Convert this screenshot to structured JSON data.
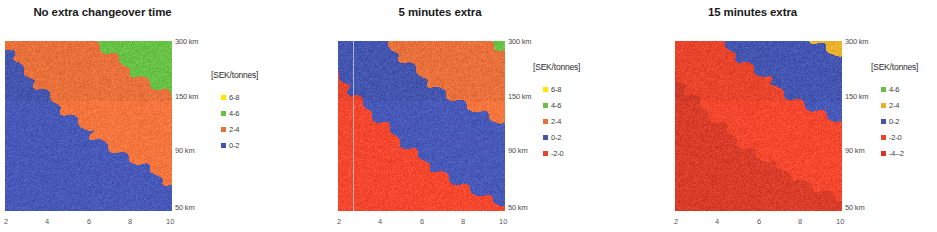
{
  "figure": {
    "units_label": "[SEK/tonnes]",
    "x_ticks": [
      "2",
      "4",
      "6",
      "8",
      "10"
    ],
    "y_ticks": [
      "300 km",
      "150 km",
      "90 km",
      "50 km"
    ]
  },
  "panels": [
    {
      "title": "No extra changeover time",
      "legend_title": "[SEK/tonnes]",
      "legend": [
        {
          "label": "6-8",
          "color": "#ffe600"
        },
        {
          "label": "4-6",
          "color": "#66c145"
        },
        {
          "label": "2-4",
          "color": "#e8703a"
        },
        {
          "label": "0-2",
          "color": "#4455b0"
        }
      ],
      "x_ticks": [
        "2",
        "4",
        "6",
        "8",
        "10"
      ],
      "y_ticks": [
        "300 km",
        "150 km",
        "90 km",
        "50 km"
      ]
    },
    {
      "title": "5 minutes extra",
      "legend_title": "[SEK/tonnes]",
      "legend": [
        {
          "label": "6-8",
          "color": "#ffe600"
        },
        {
          "label": "4-6",
          "color": "#66c145"
        },
        {
          "label": "2-4",
          "color": "#e8703a"
        },
        {
          "label": "0-2",
          "color": "#4455b0"
        },
        {
          "label": "-2-0",
          "color": "#e8442c"
        }
      ],
      "x_ticks": [
        "2",
        "4",
        "6",
        "8",
        "10"
      ],
      "y_ticks": [
        "300 km",
        "150 km",
        "90 km",
        "50 km"
      ]
    },
    {
      "title": "15 minutes extra",
      "legend_title": "[SEK/tonnes]",
      "legend": [
        {
          "label": "4-6",
          "color": "#66c145"
        },
        {
          "label": "2-4",
          "color": "#e8b12a"
        },
        {
          "label": "0-2",
          "color": "#4455b0"
        },
        {
          "label": "-2-0",
          "color": "#e8442c"
        },
        {
          "label": "-4--2",
          "color": "#cf3a28"
        }
      ],
      "x_ticks": [
        "2",
        "4",
        "6",
        "8",
        "10"
      ],
      "y_ticks": [
        "300 km",
        "150 km",
        "90 km",
        "50 km"
      ]
    }
  ],
  "chart_data": [
    {
      "type": "heatmap",
      "title": "No extra changeover time",
      "xlabel": "",
      "ylabel": "",
      "x": [
        2,
        4,
        6,
        8,
        10
      ],
      "y_tick_labels": [
        "50 km",
        "90 km",
        "150 km",
        "300 km"
      ],
      "legend_position": "right",
      "grid": false,
      "bands": [
        "0-2",
        "2-4",
        "4-6",
        "6-8"
      ],
      "band_colors": [
        "#4455b0",
        "#e8703a",
        "#66c145",
        "#ffe600"
      ],
      "note": "Cost surface vs number of trucks (x: 2-10) and distance (y: 50-300 km). Lower-left region is 0-2 SEK/tonnes (blue); a broad 2-4 (orange) diagonal band rises to upper-right; 4-6 (green) occupies the top-right corner; 6-8 (yellow) appears only as a sliver at extreme top-right.",
      "values": [
        [
          0.4,
          0.6,
          0.9,
          1.2,
          1.5
        ],
        [
          0.6,
          0.9,
          1.3,
          1.8,
          2.3
        ],
        [
          0.9,
          1.4,
          2.1,
          2.8,
          3.3
        ],
        [
          1.4,
          2.2,
          3.0,
          3.7,
          4.3
        ],
        [
          2.1,
          3.1,
          3.9,
          4.6,
          5.4
        ]
      ]
    },
    {
      "type": "heatmap",
      "title": "5 minutes extra",
      "xlabel": "",
      "ylabel": "",
      "x": [
        2,
        4,
        6,
        8,
        10
      ],
      "y_tick_labels": [
        "50 km",
        "90 km",
        "150 km",
        "300 km"
      ],
      "legend_position": "right",
      "grid": false,
      "bands": [
        "-2-0",
        "0-2",
        "2-4",
        "4-6",
        "6-8"
      ],
      "band_colors": [
        "#e8442c",
        "#4455b0",
        "#e8703a",
        "#66c145",
        "#ffe600"
      ],
      "note": "Shifted down one band versus panel 1. Lower-left is -2-0 SEK/tonnes (red-orange); a wide 0-2 (blue) diagonal band crosses the middle; 2-4 (orange) above it; 4-6 (green) only at the top-right corner.",
      "values": [
        [
          -1.6,
          -1.3,
          -0.9,
          -0.5,
          -0.1
        ],
        [
          -1.3,
          -0.8,
          -0.2,
          0.4,
          0.9
        ],
        [
          -0.8,
          -0.1,
          0.7,
          1.4,
          2.0
        ],
        [
          -0.2,
          0.8,
          1.8,
          2.6,
          3.2
        ],
        [
          0.6,
          1.9,
          2.9,
          3.7,
          4.2
        ]
      ]
    },
    {
      "type": "heatmap",
      "title": "15 minutes extra",
      "xlabel": "",
      "ylabel": "",
      "x": [
        2,
        4,
        6,
        8,
        10
      ],
      "y_tick_labels": [
        "50 km",
        "90 km",
        "150 km",
        "300 km"
      ],
      "legend_position": "right",
      "grid": false,
      "bands": [
        "-4--2",
        "-2-0",
        "0-2",
        "2-4",
        "4-6"
      ],
      "band_colors": [
        "#cf3a28",
        "#e8442c",
        "#4455b0",
        "#e8b12a",
        "#66c145"
      ],
      "note": "Shifted down further. Left/lower-left is -4--2 SEK/tonnes (dark red); the dominant salmon region is -2-0; a 0-2 (blue) band sits in the upper-right; 2-4 (gold) at the very top-right corner.",
      "values": [
        [
          -3.5,
          -3.2,
          -2.9,
          -2.6,
          -2.3
        ],
        [
          -3.2,
          -2.7,
          -2.2,
          -1.8,
          -1.3
        ],
        [
          -2.8,
          -2.1,
          -1.4,
          -0.7,
          -0.1
        ],
        [
          -2.2,
          -1.2,
          -0.3,
          0.6,
          1.3
        ],
        [
          -1.4,
          -0.1,
          0.9,
          1.8,
          2.5
        ]
      ]
    }
  ]
}
